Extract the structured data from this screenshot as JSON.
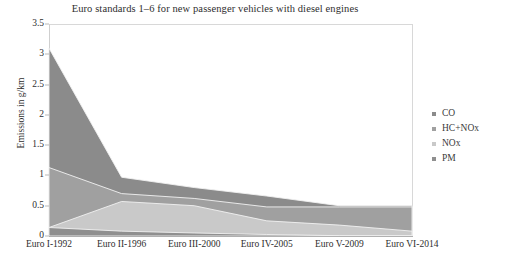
{
  "chart_data": {
    "type": "area",
    "stacked": true,
    "title": "Euro standards 1–6 for new passenger vehicles with diesel engines",
    "xlabel": "",
    "ylabel": "Emissions in g/km",
    "categories": [
      "Euro I-1992",
      "Euro II-1996",
      "Euro III-2000",
      "Euro IV-2005",
      "Euro V-2009",
      "Euro VI-2014"
    ],
    "ylim": [
      0,
      3.5
    ],
    "yticks": [
      "0",
      "0.5",
      "1",
      "1.5",
      "2",
      "2.5",
      "3",
      "3.5"
    ],
    "ytick_values": [
      0,
      0.5,
      1,
      1.5,
      2,
      2.5,
      3,
      3.5
    ],
    "grid": false,
    "legend_position": "right",
    "series": [
      {
        "name": "PM",
        "values": [
          0.14,
          0.08,
          0.05,
          0.025,
          0.005,
          0.005
        ],
        "color": "#8f8f8f"
      },
      {
        "name": "NOx",
        "values": [
          0.0,
          0.49,
          0.45,
          0.225,
          0.175,
          0.075
        ],
        "color": "#c9c9c9"
      },
      {
        "name": "HC+NOx",
        "values": [
          0.99,
          0.13,
          0.12,
          0.23,
          0.3,
          0.4
        ],
        "color": "#a0a0a0"
      },
      {
        "name": "CO",
        "values": [
          1.97,
          0.27,
          0.18,
          0.18,
          0.02,
          0.02
        ],
        "color": "#8b8b8b"
      }
    ],
    "stack_tops": {
      "PM": [
        0.14,
        0.08,
        0.05,
        0.025,
        0.005,
        0.005
      ],
      "NOx": [
        0.14,
        0.57,
        0.5,
        0.25,
        0.18,
        0.08
      ],
      "HC+NOx": [
        1.13,
        0.7,
        0.62,
        0.48,
        0.48,
        0.48
      ],
      "CO": [
        3.1,
        0.97,
        0.8,
        0.66,
        0.5,
        0.5
      ]
    }
  },
  "legend": {
    "items": [
      {
        "label": "CO"
      },
      {
        "label": "HC+NOx"
      },
      {
        "label": "NOx"
      },
      {
        "label": "PM"
      }
    ]
  },
  "colors": {
    "co": "#8b8b8b",
    "hc_nox": "#a0a0a0",
    "nox": "#c9c9c9",
    "pm": "#8f8f8f",
    "axis": "#cfcfcf",
    "text": "#2e2e2e",
    "background": "#ffffff"
  }
}
